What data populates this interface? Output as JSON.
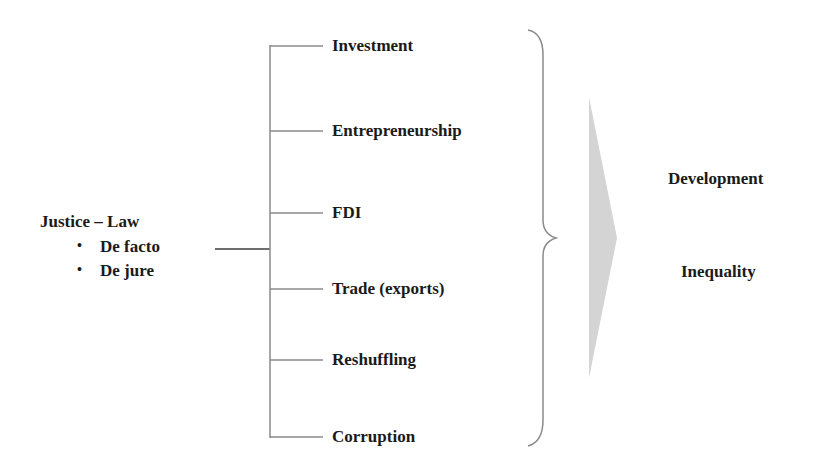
{
  "source": {
    "title": "Justice – Law",
    "items": [
      "De facto",
      "De jure"
    ],
    "bullet": "•"
  },
  "channels": [
    "Investment",
    "Entrepreneurship",
    "FDI",
    "Trade (exports)",
    "Reshuffling",
    "Corruption"
  ],
  "outcomes": [
    "Development",
    "Inequality"
  ],
  "colors": {
    "line": "#8a8a8a",
    "arrow": "#d4d4d4",
    "text": "#1a1a1a"
  }
}
